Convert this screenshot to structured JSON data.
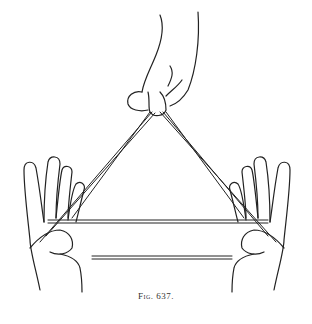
{
  "figure": {
    "caption": "Fig. 637.",
    "ink_color": "#222222",
    "background": "#ffffff"
  }
}
